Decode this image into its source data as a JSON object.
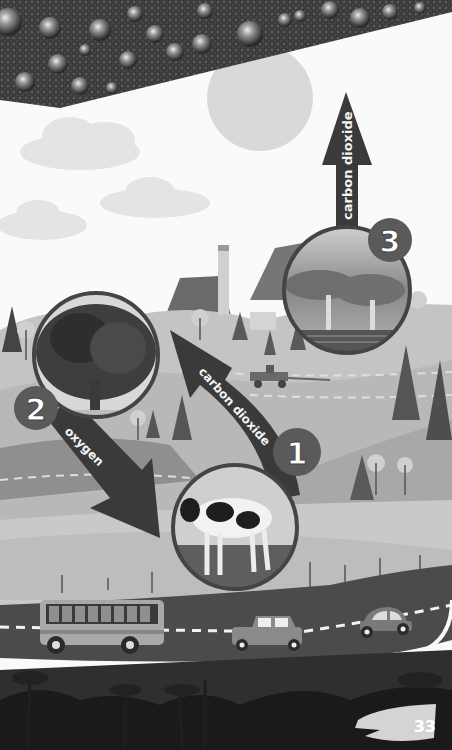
{
  "page": {
    "number": "33"
  },
  "arrows": {
    "arrow_1": {
      "label": "carbon dioxide",
      "step": "1"
    },
    "arrow_2": {
      "label": "oxygen",
      "step": "2"
    },
    "arrow_3": {
      "label": "carbon dioxide",
      "step": "3"
    }
  },
  "circles": [
    {
      "subject": "tree",
      "step": "2"
    },
    {
      "subject": "cow",
      "step": "1"
    },
    {
      "subject": "factory",
      "step": "3"
    }
  ],
  "scene": {
    "vehicles": [
      "bus",
      "car",
      "small-car",
      "tractor"
    ]
  },
  "colors": {
    "arrow": "#3a3a3a",
    "badge": "#5a5a5a",
    "sky": "#fafafa",
    "sun": "#d8d8d8",
    "ground": "#b9b9b9",
    "road": "#4b4b4b",
    "forest": "#1e1e1e",
    "droplets": "#3c3c3c"
  }
}
